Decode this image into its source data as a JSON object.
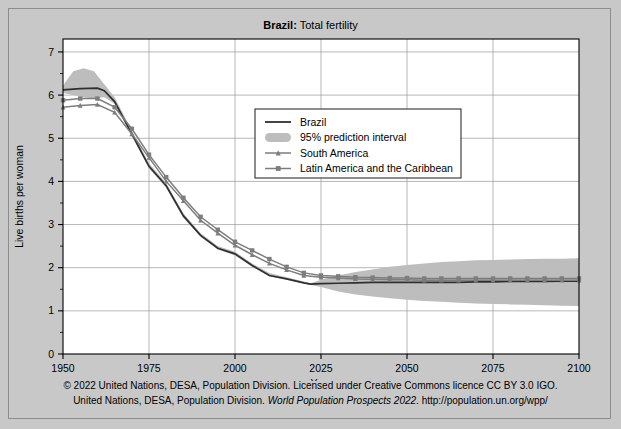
{
  "figure": {
    "title_bold": "Brazil:",
    "title_rest": " Total fertility",
    "background_color": "#c8c8c8",
    "plot_background": "#ffffff"
  },
  "footer": {
    "line1": "© 2022 United Nations, DESA, Population Division. Licensed under Creative Commons licence CC BY 3.0 IGO.",
    "line2_a": "United Nations, DESA, Population Division. ",
    "line2_italic": "World Population Prospects 2022",
    "line2_b": ". http://population.un.org/wpp/"
  },
  "legend": {
    "items": [
      {
        "label": "Brazil",
        "marker": "line",
        "color": "#2f2f2f"
      },
      {
        "label": "95% prediction interval",
        "marker": "band",
        "color": "#bdbdbd"
      },
      {
        "label": "South America",
        "marker": "line-triangle",
        "color": "#7d7d7d"
      },
      {
        "label": "Latin America and the Caribbean",
        "marker": "line-square",
        "color": "#7d7d7d"
      }
    ]
  },
  "chart_data": {
    "type": "line",
    "title": "Brazil: Total fertility",
    "xlabel": "Year",
    "ylabel": "Live births per woman",
    "xlim": [
      1950,
      2100
    ],
    "ylim": [
      0,
      7.3
    ],
    "xticks": [
      1950,
      1975,
      2000,
      2025,
      2050,
      2075,
      2100
    ],
    "xtick_labels": [
      "1950",
      "1975",
      "2000",
      "2025",
      "2050",
      "2075",
      "2100"
    ],
    "yticks": [
      0,
      1,
      2,
      3,
      4,
      5,
      6,
      7
    ],
    "ytick_labels": [
      "0",
      "1",
      "2",
      "3",
      "4",
      "5",
      "6",
      "7"
    ],
    "yminor_step": 0.5,
    "grid": true,
    "legend_position": "upper-center-right",
    "series": [
      {
        "name": "Brazil",
        "color": "#2f2f2f",
        "marker": "none",
        "x": [
          1950,
          1955,
          1960,
          1962,
          1965,
          1970,
          1975,
          1980,
          1985,
          1990,
          1995,
          2000,
          2005,
          2010,
          2015,
          2020,
          2022,
          2025,
          2030,
          2035,
          2040,
          2045,
          2050,
          2055,
          2060,
          2065,
          2070,
          2075,
          2080,
          2085,
          2090,
          2095,
          2100
        ],
        "y": [
          6.12,
          6.15,
          6.16,
          6.1,
          5.85,
          5.1,
          4.35,
          3.9,
          3.2,
          2.75,
          2.45,
          2.32,
          2.05,
          1.82,
          1.74,
          1.65,
          1.62,
          1.63,
          1.64,
          1.65,
          1.66,
          1.66,
          1.66,
          1.66,
          1.66,
          1.66,
          1.67,
          1.67,
          1.68,
          1.68,
          1.68,
          1.69,
          1.69
        ]
      },
      {
        "name": "South America",
        "color": "#7d7d7d",
        "marker": "triangle",
        "x": [
          1950,
          1955,
          1960,
          1965,
          1970,
          1975,
          1980,
          1985,
          1990,
          1995,
          2000,
          2005,
          2010,
          2015,
          2020,
          2025,
          2030,
          2035,
          2040,
          2045,
          2050,
          2055,
          2060,
          2065,
          2070,
          2075,
          2080,
          2085,
          2090,
          2095,
          2100
        ],
        "y": [
          5.72,
          5.76,
          5.78,
          5.6,
          5.1,
          4.55,
          4.0,
          3.55,
          3.1,
          2.8,
          2.52,
          2.3,
          2.1,
          1.95,
          1.82,
          1.78,
          1.76,
          1.74,
          1.73,
          1.72,
          1.72,
          1.71,
          1.71,
          1.71,
          1.71,
          1.71,
          1.71,
          1.71,
          1.71,
          1.71,
          1.71
        ]
      },
      {
        "name": "Latin America and the Caribbean",
        "color": "#7d7d7d",
        "marker": "square",
        "x": [
          1950,
          1955,
          1960,
          1965,
          1970,
          1975,
          1980,
          1985,
          1990,
          1995,
          2000,
          2005,
          2010,
          2015,
          2020,
          2025,
          2030,
          2035,
          2040,
          2045,
          2050,
          2055,
          2060,
          2065,
          2070,
          2075,
          2080,
          2085,
          2090,
          2095,
          2100
        ],
        "y": [
          5.88,
          5.92,
          5.92,
          5.72,
          5.22,
          4.62,
          4.1,
          3.62,
          3.18,
          2.88,
          2.6,
          2.4,
          2.2,
          2.02,
          1.88,
          1.82,
          1.8,
          1.78,
          1.77,
          1.76,
          1.76,
          1.75,
          1.75,
          1.75,
          1.75,
          1.75,
          1.75,
          1.75,
          1.75,
          1.75,
          1.75
        ]
      }
    ],
    "prediction_interval": {
      "name": "95% prediction interval",
      "color": "#bdbdbd",
      "x": [
        1950,
        1953,
        1956,
        1959,
        1962,
        1965,
        1970,
        1975,
        1980,
        1985,
        1990,
        1995,
        2000,
        2005,
        2010,
        2015,
        2020,
        2022,
        2025,
        2030,
        2035,
        2040,
        2045,
        2050,
        2055,
        2060,
        2065,
        2070,
        2075,
        2080,
        2085,
        2090,
        2095,
        2100
      ],
      "lower": [
        6.05,
        6.0,
        5.95,
        5.92,
        5.95,
        5.8,
        5.05,
        4.3,
        3.85,
        3.16,
        2.72,
        2.42,
        2.28,
        2.02,
        1.8,
        1.72,
        1.63,
        1.6,
        1.55,
        1.45,
        1.38,
        1.33,
        1.29,
        1.26,
        1.23,
        1.21,
        1.19,
        1.17,
        1.16,
        1.15,
        1.14,
        1.13,
        1.12,
        1.11
      ],
      "upper": [
        6.22,
        6.55,
        6.62,
        6.55,
        6.25,
        5.95,
        5.18,
        4.42,
        3.96,
        3.26,
        2.8,
        2.5,
        2.37,
        2.1,
        1.88,
        1.78,
        1.68,
        1.64,
        1.72,
        1.82,
        1.9,
        1.96,
        2.02,
        2.06,
        2.1,
        2.13,
        2.15,
        2.17,
        2.18,
        2.19,
        2.2,
        2.21,
        2.21,
        2.22
      ]
    }
  }
}
